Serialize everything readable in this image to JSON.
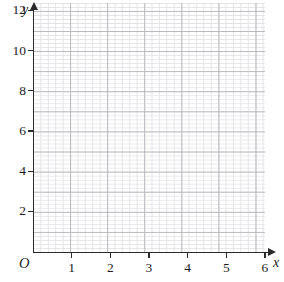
{
  "figure": {
    "kind": "coordinate-grid",
    "title": "",
    "background_color": "#ffffff",
    "axis_color": "#2b2b2b",
    "major_grid_color": "#b9b9bd",
    "minor_grid_color": "#e3e3e6"
  },
  "axes": {
    "x": {
      "name": "x",
      "origin_label": "O",
      "min": 0,
      "max": 6,
      "tick_step": 1,
      "minor_per_major": 5,
      "tick_labels": [
        "1",
        "2",
        "3",
        "4",
        "5",
        "6"
      ],
      "tick_values": [
        1,
        2,
        3,
        4,
        5,
        6
      ],
      "has_arrow": true
    },
    "y": {
      "name": "y",
      "min": 0,
      "max": 12,
      "tick_step": 2,
      "minor_per_major": 5,
      "tick_labels": [
        "2",
        "4",
        "6",
        "8",
        "10",
        "12"
      ],
      "tick_values": [
        2,
        4,
        6,
        8,
        10,
        12
      ],
      "has_arrow": true
    }
  },
  "chart_data": {
    "type": "scatter",
    "title": "",
    "xlabel": "x",
    "ylabel": "y",
    "xlim": [
      0,
      6
    ],
    "ylim": [
      0,
      12
    ],
    "grid": true,
    "minor_grid": true,
    "legend": null,
    "series": [],
    "annotations": [],
    "note": "Empty graph-paper coordinate plane with no plotted data."
  }
}
